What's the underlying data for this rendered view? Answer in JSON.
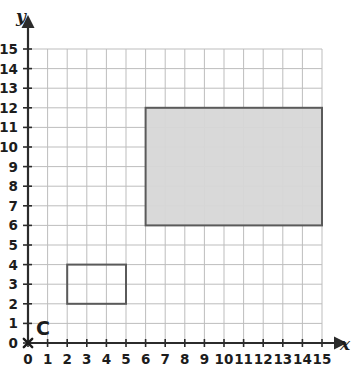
{
  "chart_data": {
    "type": "scatter",
    "title": "",
    "xlabel": "x",
    "ylabel": "y",
    "xlim": [
      0,
      15
    ],
    "ylim": [
      0,
      15
    ],
    "grid": true,
    "legend": "none",
    "x_ticks": [
      "0",
      "1",
      "2",
      "3",
      "4",
      "5",
      "6",
      "7",
      "8",
      "9",
      "10",
      "11",
      "12",
      "13",
      "14",
      "15"
    ],
    "y_ticks": [
      "0",
      "1",
      "2",
      "3",
      "4",
      "5",
      "6",
      "7",
      "8",
      "9",
      "10",
      "11",
      "12",
      "13",
      "14",
      "15"
    ],
    "points": [
      {
        "label": "C",
        "x": 0,
        "y": 0,
        "marker": "x"
      }
    ],
    "shapes": [
      {
        "name": "small-rectangle",
        "type": "rect",
        "x_min": 2,
        "x_max": 5,
        "y_min": 2,
        "y_max": 4,
        "width_units": 3,
        "height_units": 2,
        "fill": "none",
        "stroke": "#5a5a5a"
      },
      {
        "name": "large-rectangle",
        "type": "rect",
        "x_min": 6,
        "x_max": 15,
        "y_min": 6,
        "y_max": 12,
        "width_units": 9,
        "height_units": 6,
        "fill": "#d7d7d7",
        "stroke": "#5a5a5a"
      }
    ]
  },
  "axes": {
    "x_axis_label": "x",
    "y_axis_label": "y",
    "origin_point_label": "C"
  },
  "colors": {
    "background": "#ffffff",
    "grid_line": "#bdbdbd",
    "axis_line": "#2b2b2b",
    "shape_stroke": "#5a5a5a",
    "shape_fill": "#d7d7d7",
    "text": "#1c1c1c"
  }
}
